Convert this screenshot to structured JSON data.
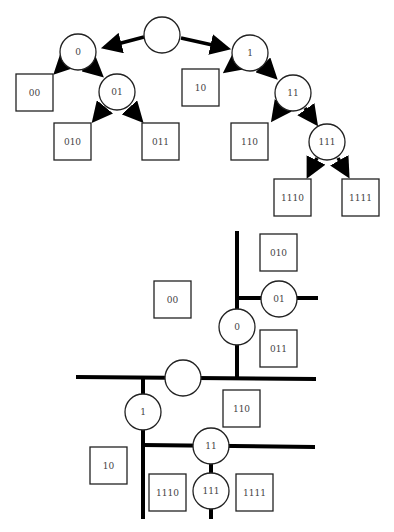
{
  "tree": {
    "root": {
      "label": ""
    },
    "internal_nodes": [
      {
        "id": "n0",
        "label": "0"
      },
      {
        "id": "n1",
        "label": "1"
      },
      {
        "id": "n01",
        "label": "01"
      },
      {
        "id": "n11",
        "label": "11"
      },
      {
        "id": "n111",
        "label": "111"
      }
    ],
    "leaves": [
      {
        "id": "l00",
        "label": "00"
      },
      {
        "id": "l010",
        "label": "010"
      },
      {
        "id": "l011",
        "label": "011"
      },
      {
        "id": "l10",
        "label": "10"
      },
      {
        "id": "l110",
        "label": "110"
      },
      {
        "id": "l1110",
        "label": "1110"
      },
      {
        "id": "l1111",
        "label": "1111"
      }
    ]
  },
  "partition": {
    "root": {
      "label": ""
    },
    "internal_nodes": [
      {
        "id": "p0",
        "label": "0"
      },
      {
        "id": "p1",
        "label": "1"
      },
      {
        "id": "p01",
        "label": "01"
      },
      {
        "id": "p11",
        "label": "11"
      },
      {
        "id": "p111",
        "label": "111"
      }
    ],
    "leaves": [
      {
        "id": "q00",
        "label": "00"
      },
      {
        "id": "q010",
        "label": "010"
      },
      {
        "id": "q011",
        "label": "011"
      },
      {
        "id": "q10",
        "label": "10"
      },
      {
        "id": "q110",
        "label": "110"
      },
      {
        "id": "q1110",
        "label": "1110"
      },
      {
        "id": "q1111",
        "label": "1111"
      }
    ]
  }
}
